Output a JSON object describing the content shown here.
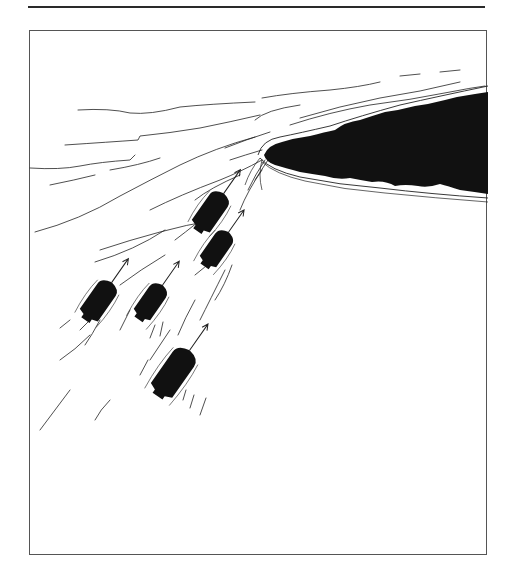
{
  "illustration": {
    "subject": "Five boats rowing toward a dark wooded island",
    "colors": {
      "ink": "#111111",
      "paper": "#ffffff",
      "frame": "#555555",
      "rule": "#2a2a2a"
    },
    "boats": [
      {
        "id": 1,
        "cx": 210,
        "cy": 213,
        "angle": 35
      },
      {
        "id": 2,
        "cx": 216,
        "cy": 250,
        "angle": 35
      },
      {
        "id": 3,
        "cx": 98,
        "cy": 302,
        "angle": 35
      },
      {
        "id": 4,
        "cx": 150,
        "cy": 303,
        "angle": 35
      },
      {
        "id": 5,
        "cx": 173,
        "cy": 374,
        "angle": 35
      }
    ],
    "island": {
      "position": "upper right",
      "fill": "#111111"
    }
  }
}
